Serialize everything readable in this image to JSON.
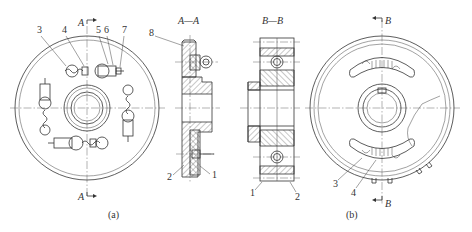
{
  "figure": {
    "views": [
      {
        "id": "a",
        "caption": "(a)",
        "section_marks": [
          "A",
          "A"
        ]
      },
      {
        "id": "AA",
        "title": "A—A"
      },
      {
        "id": "BB",
        "title": "B—B"
      },
      {
        "id": "b",
        "caption": "(b)",
        "section_marks": [
          "B",
          "B"
        ]
      }
    ],
    "labels_a": [
      "3",
      "4",
      "5",
      "6",
      "7"
    ],
    "labels_aa": [
      "8",
      "2",
      "1"
    ],
    "labels_bb": [
      "1",
      "2"
    ],
    "labels_b": [
      "3",
      "4"
    ]
  }
}
